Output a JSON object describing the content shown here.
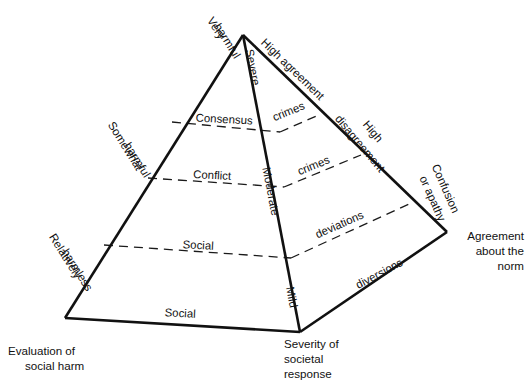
{
  "diagram": {
    "type": "pyramid-diagram",
    "ink_color": "#111111",
    "background_color": "#ffffff",
    "axes": [
      {
        "id": "left-base-axis",
        "label": "Evaluation of\nsocial harm",
        "line1": "Evaluation of",
        "line2": "social harm"
      },
      {
        "id": "front-base-axis",
        "label": "Severity of societal response",
        "line1": "Severity of",
        "line2": "societal",
        "line3": "response"
      },
      {
        "id": "right-base-axis",
        "label": "Agreement about the norm",
        "line1": "Agreement",
        "line2": "about the",
        "line3": "norm"
      }
    ],
    "left_face": {
      "edge_labels": [
        {
          "id": "very-harmful",
          "line1": "Very",
          "line2": "harmful"
        },
        {
          "id": "somewhat-harmful",
          "line1": "Somewhat",
          "line2": "harmful"
        },
        {
          "id": "relatively-harmless",
          "line1": "Relatively",
          "line2": "harmless"
        }
      ],
      "band_labels": [
        {
          "id": "consensus",
          "text": "Consensus"
        },
        {
          "id": "conflict",
          "text": "Conflict"
        },
        {
          "id": "social-upper",
          "text": "Social"
        },
        {
          "id": "social-lower",
          "text": "Social"
        }
      ]
    },
    "right_face": {
      "edge_labels": [
        {
          "id": "high-agreement",
          "text": "High agreement"
        },
        {
          "id": "high-disagreement",
          "line1": "High",
          "line2": "disagreement"
        },
        {
          "id": "confusion-or-apathy",
          "line1": "Confusion",
          "line2": "or apathy"
        }
      ],
      "band_labels": [
        {
          "id": "crimes-upper",
          "text": "crimes"
        },
        {
          "id": "crimes-lower",
          "text": "crimes"
        },
        {
          "id": "deviations",
          "text": "deviations"
        },
        {
          "id": "diversions",
          "text": "diversions"
        }
      ]
    },
    "front_edge_labels": [
      {
        "id": "severe",
        "text": "Severe"
      },
      {
        "id": "moderate",
        "text": "Moderate"
      },
      {
        "id": "mild",
        "text": "Mild"
      }
    ]
  }
}
